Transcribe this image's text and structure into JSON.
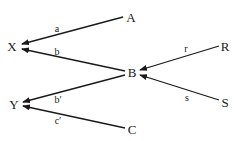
{
  "diagram": {
    "type": "path-diagram",
    "colors": {
      "stroke": "#1a1a1a",
      "background": "#ffffff"
    },
    "nodes": {
      "A": {
        "label": "A",
        "x": 131,
        "y": 17
      },
      "X": {
        "label": "X",
        "x": 12,
        "y": 46
      },
      "B": {
        "label": "B",
        "x": 132,
        "y": 72
      },
      "R": {
        "label": "R",
        "x": 225,
        "y": 46
      },
      "S": {
        "label": "S",
        "x": 225,
        "y": 102
      },
      "Y": {
        "label": "Y",
        "x": 14,
        "y": 104
      },
      "C": {
        "label": "C",
        "x": 132,
        "y": 129
      }
    },
    "edges": [
      {
        "from": "A",
        "to": "X",
        "label": "a",
        "label_x": 57,
        "label_y": 29
      },
      {
        "from": "B",
        "to": "X",
        "label": "b",
        "label_x": 57,
        "label_y": 52
      },
      {
        "from": "R",
        "to": "B",
        "label": "r",
        "label_x": 186,
        "label_y": 49
      },
      {
        "from": "S",
        "to": "B",
        "label": "s",
        "label_x": 187,
        "label_y": 98
      },
      {
        "from": "B",
        "to": "Y",
        "label": "b′",
        "label_x": 58,
        "label_y": 100
      },
      {
        "from": "C",
        "to": "Y",
        "label": "c′",
        "label_x": 58,
        "label_y": 121
      }
    ]
  }
}
